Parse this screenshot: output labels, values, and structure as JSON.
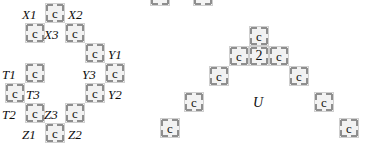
{
  "figure": {
    "title": "",
    "canvas": {
      "width": 369,
      "height": 158,
      "background": "#ffffff"
    },
    "tile": {
      "fill": "#f2f2f2",
      "border": "#cfcfcf",
      "tick": "#8e8e8e",
      "size": 20,
      "default_glyph": "c"
    }
  },
  "left_figure": {
    "name": "labelled-ring",
    "tiles": [
      {
        "id": "x-top-c",
        "glyph": "c",
        "x": 45,
        "y": 3
      },
      {
        "id": "x-row2-left",
        "glyph": "c",
        "x": 25,
        "y": 23
      },
      {
        "id": "x-row2-right",
        "glyph": "c",
        "x": 65,
        "y": 23
      },
      {
        "id": "y1-c",
        "glyph": "c",
        "x": 85,
        "y": 43
      },
      {
        "id": "y3-c",
        "glyph": "c",
        "x": 105,
        "y": 63
      },
      {
        "id": "y2-c",
        "glyph": "c",
        "x": 85,
        "y": 83
      },
      {
        "id": "z3-right-c",
        "glyph": "c",
        "x": 65,
        "y": 103
      },
      {
        "id": "z-bottom-c",
        "glyph": "c",
        "x": 45,
        "y": 123
      },
      {
        "id": "t2-c",
        "glyph": "c",
        "x": 25,
        "y": 103
      },
      {
        "id": "t3-left-c",
        "glyph": "c",
        "x": 5,
        "y": 83
      },
      {
        "id": "t1-c",
        "glyph": "c",
        "x": 25,
        "y": 63
      }
    ],
    "labels": [
      {
        "id": "X1",
        "text": "X1",
        "x": 22,
        "y": 8
      },
      {
        "id": "X2",
        "text": "X2",
        "x": 68,
        "y": 8
      },
      {
        "id": "X3",
        "text": "X3",
        "x": 44,
        "y": 28
      },
      {
        "id": "Y1",
        "text": "Y1",
        "x": 108,
        "y": 48
      },
      {
        "id": "Y3",
        "text": "Y3",
        "x": 82,
        "y": 68
      },
      {
        "id": "Y2",
        "text": "Y2",
        "x": 108,
        "y": 88
      },
      {
        "id": "Z3",
        "text": "Z3",
        "x": 44,
        "y": 108
      },
      {
        "id": "Z2",
        "text": "Z2",
        "x": 68,
        "y": 128
      },
      {
        "id": "Z1",
        "text": "Z1",
        "x": 22,
        "y": 128
      },
      {
        "id": "T2",
        "text": "T2",
        "x": 2,
        "y": 108
      },
      {
        "id": "T3",
        "text": "T3",
        "x": 26,
        "y": 88
      },
      {
        "id": "T1",
        "text": "T1",
        "x": 2,
        "y": 68
      }
    ]
  },
  "right_figure": {
    "name": "pyramid-U",
    "tiles": [
      {
        "id": "apex",
        "glyph": "c",
        "x": 249,
        "y": 26
      },
      {
        "id": "row2-left",
        "glyph": "c",
        "x": 229,
        "y": 46
      },
      {
        "id": "row2-center",
        "glyph": "2",
        "x": 249,
        "y": 46
      },
      {
        "id": "row2-right",
        "glyph": "c",
        "x": 269,
        "y": 46
      },
      {
        "id": "left-step-1",
        "glyph": "c",
        "x": 209,
        "y": 66
      },
      {
        "id": "left-step-2",
        "glyph": "c",
        "x": 184,
        "y": 92
      },
      {
        "id": "left-step-3",
        "glyph": "c",
        "x": 160,
        "y": 118
      },
      {
        "id": "right-step-1",
        "glyph": "c",
        "x": 289,
        "y": 66
      },
      {
        "id": "right-step-2",
        "glyph": "c",
        "x": 314,
        "y": 92
      },
      {
        "id": "right-step-3",
        "glyph": "c",
        "x": 339,
        "y": 118
      }
    ],
    "labels": [
      {
        "id": "U",
        "text": "U",
        "x": 253,
        "y": 96
      }
    ]
  },
  "cropped_tiles": [
    {
      "id": "crop-left",
      "x": 150,
      "y": 0
    },
    {
      "id": "crop-right",
      "x": 193,
      "y": 0
    }
  ]
}
